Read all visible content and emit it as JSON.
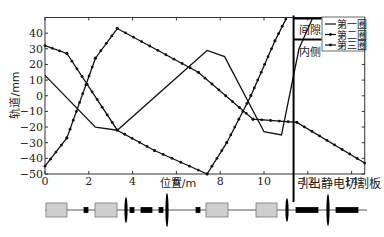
{
  "chart_data": {
    "type": "line",
    "title": "",
    "xlabel": "位置/m",
    "ylabel": "轨道/mm",
    "xlim": [
      0,
      14.6
    ],
    "ylim": [
      -50,
      50
    ],
    "xticks": [
      0,
      2,
      4,
      6,
      8,
      10,
      12,
      14
    ],
    "yticks": [
      40,
      30,
      20,
      10,
      0,
      -10,
      -20,
      -30,
      -40,
      -50
    ],
    "grid": false,
    "legend_position": "upper right",
    "series": [
      {
        "name": "第一圈",
        "marker": "none",
        "x": [
          0,
          2.3,
          3.3,
          7.4,
          8.2,
          10,
          10.8,
          11.6,
          12.2
        ],
        "y": [
          13,
          -20,
          -22,
          29,
          25,
          -23,
          -25,
          30,
          49
        ]
      },
      {
        "name": "第二圈",
        "marker": "dot",
        "x": [
          0,
          1,
          3.3,
          5,
          7.4,
          8.3,
          9.4,
          10.5,
          11
        ],
        "y": [
          32,
          27,
          -22,
          -35,
          -50,
          -30,
          0,
          35,
          49
        ]
      },
      {
        "name": "第三圈",
        "marker": "dot",
        "x": [
          0,
          1,
          2.3,
          3.3,
          7,
          9.5,
          11.5,
          14.6
        ],
        "y": [
          -45,
          -27,
          24,
          43,
          15,
          -15,
          -17,
          -43
        ]
      }
    ],
    "annotations": [
      "间隙",
      "内侧",
      "引出静电切割板"
    ]
  },
  "labels": {
    "xlabel": "位置/m",
    "ylabel": "轨道/mm",
    "gap": "间隙",
    "inner": "内侧",
    "septum": "引出静电切割板",
    "legend": [
      "第一圈",
      "第二圈",
      "第三圈"
    ]
  }
}
